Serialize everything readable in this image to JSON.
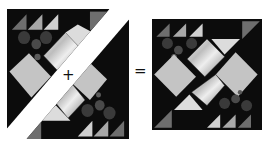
{
  "figure": {
    "operators": {
      "plus": "+",
      "equals": "="
    },
    "colors": {
      "background": "#ffffff",
      "dark": "#0c0c0c",
      "charcoal": "#3a3a3a",
      "mid_gray": "#6e6e6e",
      "gray": "#9a9a9a",
      "light_gray": "#c4c4c4",
      "pale": "#dedede",
      "silver": "#e8e8e8",
      "separator": "#ffffff"
    },
    "left_block": {
      "label": "two halves split along diagonal"
    },
    "right_block": {
      "label": "assembled block"
    }
  }
}
